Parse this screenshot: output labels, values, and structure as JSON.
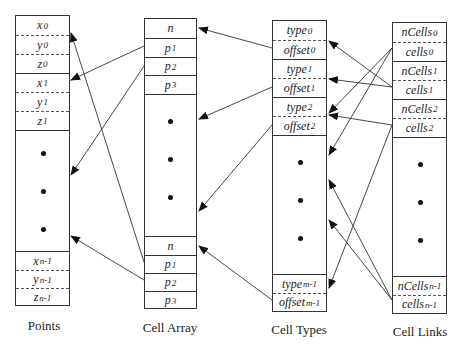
{
  "columns": {
    "points": {
      "label": "Points",
      "rows": [
        {
          "base": "x",
          "sub": "0"
        },
        {
          "base": "y",
          "sub": "0"
        },
        {
          "base": "z",
          "sub": "0"
        },
        {
          "base": "x",
          "sub": "1"
        },
        {
          "base": "y",
          "sub": "1"
        },
        {
          "base": "z",
          "sub": "1"
        },
        {
          "base": "x",
          "sub": "n-1"
        },
        {
          "base": "y",
          "sub": "n-1"
        },
        {
          "base": "z",
          "sub": "n-1"
        }
      ]
    },
    "cell_array": {
      "label": "Cell Array",
      "rows": [
        {
          "base": "n",
          "sub": ""
        },
        {
          "base": "p",
          "sub": "1"
        },
        {
          "base": "p",
          "sub": "2"
        },
        {
          "base": "p",
          "sub": "3"
        },
        {
          "base": "n",
          "sub": ""
        },
        {
          "base": "p",
          "sub": "1"
        },
        {
          "base": "p",
          "sub": "2"
        },
        {
          "base": "p",
          "sub": "3"
        }
      ]
    },
    "cell_types": {
      "label": "Cell Types",
      "rows": [
        {
          "base": "type",
          "sub": "0"
        },
        {
          "base": "offset",
          "sub": "0"
        },
        {
          "base": "type",
          "sub": "1"
        },
        {
          "base": "offset",
          "sub": "1"
        },
        {
          "base": "type",
          "sub": "2"
        },
        {
          "base": "offset",
          "sub": "2"
        },
        {
          "base": "type",
          "sub": "m-1"
        },
        {
          "base": "offset",
          "sub": "m-1"
        }
      ]
    },
    "cell_links": {
      "label": "Cell Links",
      "rows": [
        {
          "base": "nCells",
          "sub": "0"
        },
        {
          "base": "cells",
          "sub": "0"
        },
        {
          "base": "nCells",
          "sub": "1"
        },
        {
          "base": "cells",
          "sub": "1"
        },
        {
          "base": "nCells",
          "sub": "2"
        },
        {
          "base": "cells",
          "sub": "2"
        },
        {
          "base": "nCells",
          "sub": "n-1"
        },
        {
          "base": "cells",
          "sub": "n-1"
        }
      ]
    }
  }
}
